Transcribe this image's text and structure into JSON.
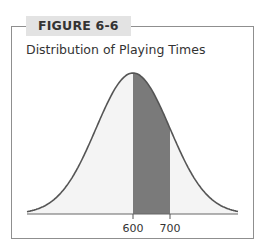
{
  "figure": {
    "label": "FIGURE 6-6",
    "title": "Distribution of Playing Times"
  },
  "colors": {
    "frame": "#8f8f8f",
    "label_bg": "#e3e3e3",
    "curve": "#555555",
    "fill_light": "#f4f4f4",
    "fill_shaded": "#7a7a7a"
  },
  "chart_data": {
    "type": "area",
    "title": "Distribution of Playing Times",
    "xlabel": "",
    "ylabel": "",
    "x_ticks": [
      600,
      700
    ],
    "x_tick_labels": [
      "600",
      "700"
    ],
    "distribution": "normal",
    "mean": 600,
    "shaded_region": {
      "from": 600,
      "to": 700
    },
    "grid": false,
    "legend": null
  }
}
